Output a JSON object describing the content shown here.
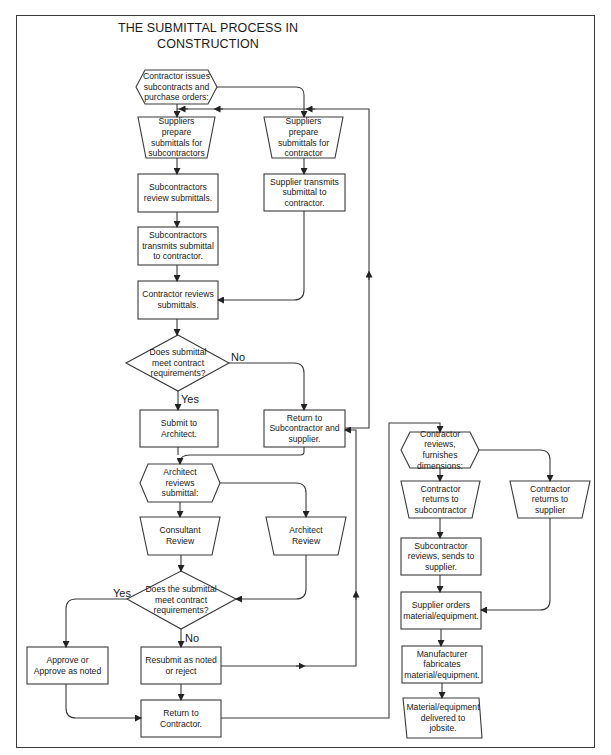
{
  "title": "THE SUBMITTAL PROCESS IN CONSTRUCTION",
  "title_lines": [
    "THE SUBMITTAL PROCESS IN",
    "CONSTRUCTION"
  ],
  "colors": {
    "stroke": "#3a3a3a",
    "background": "#ffffff",
    "text": "#1a1a1a"
  },
  "nodes": {
    "contractor_issues": {
      "shape": "hexagon",
      "text": "Contractor issues subcontracts and purchase orders:"
    },
    "suppliers_prepare_sub": {
      "shape": "trapezoid",
      "text": "Suppliers prepare submittals for subcontractors"
    },
    "suppliers_prepare_con": {
      "shape": "trapezoid",
      "text": "Suppliers prepare submittals for contractor"
    },
    "subs_review": {
      "shape": "rect",
      "text": "Subcontractors review submittals."
    },
    "supplier_transmits": {
      "shape": "rect",
      "text": "Supplier transmits submittal to contractor."
    },
    "subs_transmit": {
      "shape": "rect",
      "text": "Subcontractors transmits submittal to contractor."
    },
    "contractor_reviews": {
      "shape": "rect",
      "text": "Contractor reviews submittals."
    },
    "decision1": {
      "shape": "diamond",
      "text": "Does submittal meet contract requirements?"
    },
    "submit_architect": {
      "shape": "rect",
      "text": "Submit to Architect."
    },
    "return_sub_supplier": {
      "shape": "rect",
      "text": "Return to Subcontractor and supplier."
    },
    "architect_reviews": {
      "shape": "hexagon",
      "text": "Architect reviews submittal:"
    },
    "consultant_review": {
      "shape": "trapezoid",
      "text": "Consultant Review"
    },
    "architect_review": {
      "shape": "trapezoid",
      "text": "Architect Review"
    },
    "decision2": {
      "shape": "diamond",
      "text": "Does the submittal meet contract requirements?"
    },
    "approve": {
      "shape": "rect",
      "text": "Approve or Approve as noted"
    },
    "resubmit": {
      "shape": "rect",
      "text": "Resubmit as noted or reject"
    },
    "return_contractor": {
      "shape": "rect",
      "text": "Return to Contractor."
    },
    "contractor_furnishes": {
      "shape": "hexagon",
      "text": "Contractor reviews, furnishes dimensions:"
    },
    "returns_to_sub": {
      "shape": "trapezoid",
      "text": "Contractor returns to subcontractor"
    },
    "returns_to_supplier": {
      "shape": "trapezoid",
      "text": "Contractor returns to supplier"
    },
    "sub_sends_supplier": {
      "shape": "rect",
      "text": "Subcontractor reviews, sends to supplier."
    },
    "supplier_orders": {
      "shape": "rect",
      "text": "Supplier orders material/equipment."
    },
    "manufacturer_fabricates": {
      "shape": "rect",
      "text": "Manufacturer fabricates material/equipment."
    },
    "delivered": {
      "shape": "parallelogram",
      "text": "Material/equipment delivered to jobsite."
    }
  },
  "edge_labels": {
    "d1_no": "No",
    "d1_yes": "Yes",
    "d2_yes": "Yes",
    "d2_no": "No"
  }
}
